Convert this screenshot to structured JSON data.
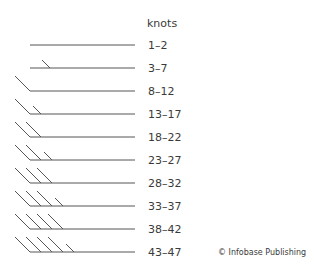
{
  "header": {
    "title": "knots"
  },
  "rows": [
    {
      "label": "1–2",
      "long_barbs": 0,
      "short_barbs": 0
    },
    {
      "label": "3–7",
      "long_barbs": 0,
      "short_barbs": 1
    },
    {
      "label": "8–12",
      "long_barbs": 1,
      "short_barbs": 0
    },
    {
      "label": "13–17",
      "long_barbs": 1,
      "short_barbs": 1
    },
    {
      "label": "18–22",
      "long_barbs": 2,
      "short_barbs": 0
    },
    {
      "label": "23–27",
      "long_barbs": 2,
      "short_barbs": 1
    },
    {
      "label": "28–32",
      "long_barbs": 3,
      "short_barbs": 0
    },
    {
      "label": "33–37",
      "long_barbs": 3,
      "short_barbs": 1
    },
    {
      "label": "38–42",
      "long_barbs": 4,
      "short_barbs": 0
    },
    {
      "label": "43–47",
      "long_barbs": 4,
      "short_barbs": 1
    }
  ],
  "credit": "© Infobase Publishing",
  "colors": {
    "line": "#555555",
    "text": "#3a3a3a"
  }
}
